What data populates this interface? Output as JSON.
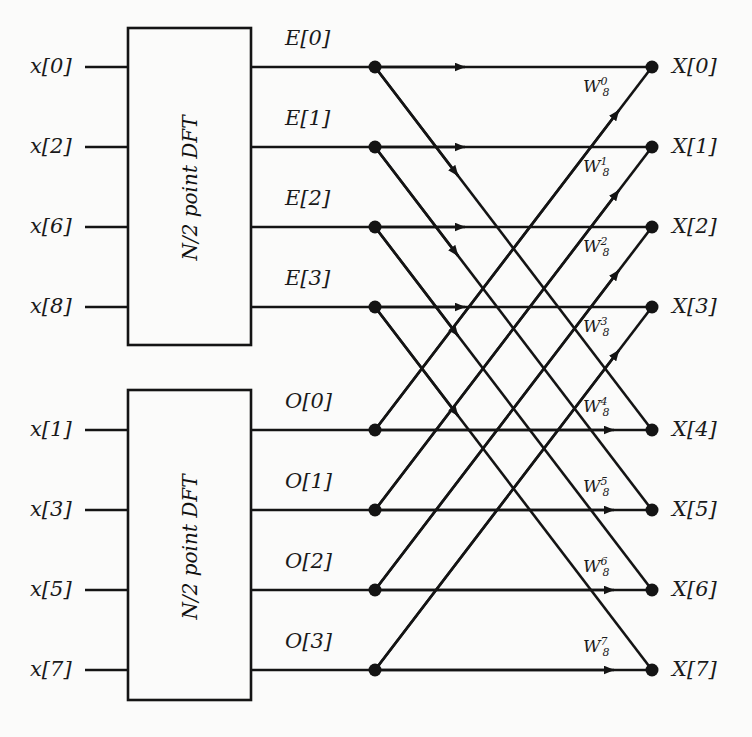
{
  "figure": {
    "line_color": "#141414",
    "background": "#fbfbfa"
  },
  "blocks": [
    {
      "id": "even-dft",
      "label": "N/2 point DFT"
    },
    {
      "id": "odd-dft",
      "label": "N/2 point DFT"
    }
  ],
  "inputs_even": [
    {
      "label": "x[0]"
    },
    {
      "label": "x[2]"
    },
    {
      "label": "x[6]"
    },
    {
      "label": "x[8]"
    }
  ],
  "inputs_odd": [
    {
      "label": "x[1]"
    },
    {
      "label": "x[3]"
    },
    {
      "label": "x[5]"
    },
    {
      "label": "x[7]"
    }
  ],
  "even_outputs": [
    {
      "label": "E[0]"
    },
    {
      "label": "E[1]"
    },
    {
      "label": "E[2]"
    },
    {
      "label": "E[3]"
    }
  ],
  "odd_outputs": [
    {
      "label": "O[0]"
    },
    {
      "label": "O[1]"
    },
    {
      "label": "O[2]"
    },
    {
      "label": "O[3]"
    }
  ],
  "twiddles": [
    {
      "base": "W",
      "sub": "8",
      "sup": "0"
    },
    {
      "base": "W",
      "sub": "8",
      "sup": "1"
    },
    {
      "base": "W",
      "sub": "8",
      "sup": "2"
    },
    {
      "base": "W",
      "sub": "8",
      "sup": "3"
    },
    {
      "base": "W",
      "sub": "8",
      "sup": "4"
    },
    {
      "base": "W",
      "sub": "8",
      "sup": "5"
    },
    {
      "base": "W",
      "sub": "8",
      "sup": "6"
    },
    {
      "base": "W",
      "sub": "8",
      "sup": "7"
    }
  ],
  "outputs": [
    {
      "label": "X[0]"
    },
    {
      "label": "X[1]"
    },
    {
      "label": "X[2]"
    },
    {
      "label": "X[3]"
    },
    {
      "label": "X[4]"
    },
    {
      "label": "X[5]"
    },
    {
      "label": "X[6]"
    },
    {
      "label": "X[7]"
    }
  ]
}
